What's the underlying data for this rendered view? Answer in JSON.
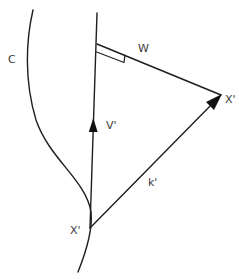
{
  "diagram": {
    "title": "",
    "labels": {
      "curve": "C",
      "perpendicular": "W",
      "tangent_vector": "V'",
      "point_far": "X'",
      "point_on_curve": "X'",
      "connecting_vector": "k'"
    },
    "colors": {
      "stroke": "#1e1e1e",
      "label": "#3a3a3a",
      "background": "#ffffff"
    },
    "elements": [
      {
        "id": "curve-c",
        "type": "curve",
        "label": "C"
      },
      {
        "id": "vertical-line-v",
        "type": "arrow",
        "label": "V'",
        "from": "X' (on curve)",
        "direction": "up"
      },
      {
        "id": "line-w",
        "type": "segment",
        "label": "W",
        "note": "perpendicular to V' (right-angle marker)"
      },
      {
        "id": "arrow-k",
        "type": "arrow",
        "label": "k'",
        "from": "X' (on curve)",
        "to": "X' (far)"
      }
    ]
  }
}
